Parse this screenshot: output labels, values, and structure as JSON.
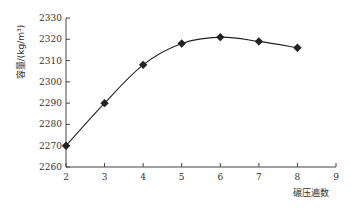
{
  "chart_data": {
    "type": "line",
    "title": "",
    "xlabel": "碾压遍数",
    "ylabel": "容量/(kg/m³)",
    "x": [
      2,
      3,
      4,
      5,
      6,
      7,
      8
    ],
    "series": [
      {
        "name": "容量",
        "values": [
          2270,
          2290,
          2308,
          2318,
          2321,
          2319,
          2316
        ],
        "marker": "diamond",
        "color": "#222222",
        "smooth": true
      }
    ],
    "xlim": [
      2,
      9
    ],
    "ylim": [
      2260,
      2330
    ],
    "xticks": [
      2,
      3,
      4,
      5,
      6,
      7,
      8,
      9
    ],
    "yticks": [
      2260,
      2270,
      2280,
      2290,
      2300,
      2310,
      2320,
      2330
    ],
    "grid": false,
    "legend": null
  }
}
